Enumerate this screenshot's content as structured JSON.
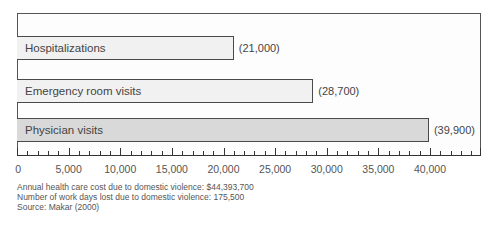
{
  "chart_data": {
    "type": "bar",
    "orientation": "horizontal",
    "title": "",
    "categories": [
      "Hospitalizations",
      "Emergency room visits",
      "Physician visits"
    ],
    "values": [
      21000,
      28700,
      39900
    ],
    "value_labels": [
      "(21,000)",
      "(28,700)",
      "(39,900)"
    ],
    "bar_colors": [
      "#f1f1f1",
      "#f1f1f1",
      "#d9d9d9"
    ],
    "xlabel": "",
    "ylabel": "",
    "xlim": [
      0,
      45000
    ],
    "x_ticks": [
      0,
      5000,
      10000,
      15000,
      20000,
      25000,
      30000,
      35000,
      40000
    ],
    "x_tick_labels": [
      "0",
      "5,000",
      "10,000",
      "15,000",
      "20,000",
      "25,000",
      "30,000",
      "35,000",
      "40,000"
    ],
    "minor_tick_step": 1000,
    "grid": false,
    "legend": null,
    "annotations": [
      "Annual health care cost due to domestic violence: $44,393,700",
      "Number of work days lost due to domestic violence: 175,500",
      "Source: Makar (2000)"
    ]
  },
  "notes": {
    "line1": "Annual health care cost due to domestic violence: $44,393,700",
    "line2": "Number of work days lost due to domestic violence: 175,500",
    "line3": "Source: Makar (2000)"
  }
}
